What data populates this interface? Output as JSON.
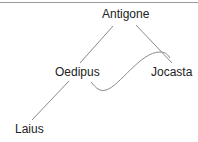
{
  "diagram": {
    "nodes": [
      {
        "id": "antigone",
        "label": "Antigone"
      },
      {
        "id": "oedipus",
        "label": "Oedipus"
      },
      {
        "id": "jocasta",
        "label": "Jocasta"
      },
      {
        "id": "laius",
        "label": "Laius"
      }
    ],
    "edges": [
      {
        "from": "oedipus",
        "to": "antigone",
        "style": "straight"
      },
      {
        "from": "antigone",
        "to": "jocasta",
        "style": "straight"
      },
      {
        "from": "laius",
        "to": "oedipus",
        "style": "straight"
      },
      {
        "from": "oedipus",
        "to": "jocasta",
        "style": "curved"
      }
    ],
    "line_color": "#8a8a8a"
  }
}
